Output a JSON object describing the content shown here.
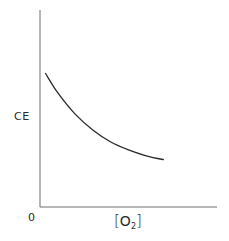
{
  "chart_data": {
    "type": "line",
    "title": "",
    "xlabel": "[O2]",
    "ylabel": "CE",
    "origin_label": "0",
    "x_ticks": [],
    "y_ticks": [],
    "grid": false,
    "legend": null,
    "series": [
      {
        "name": "CE vs [O2]",
        "x": [
          0.03,
          0.1,
          0.2,
          0.3,
          0.4,
          0.5,
          0.6,
          0.7
        ],
        "values": [
          0.68,
          0.58,
          0.47,
          0.39,
          0.33,
          0.29,
          0.26,
          0.24
        ]
      }
    ],
    "xlim": [
      0,
      1
    ],
    "ylim": [
      0,
      1
    ],
    "colors": {
      "axis": "#6e6e6e",
      "curve": "#2a2a2a",
      "text": "#2a2a2a"
    }
  },
  "labels": {
    "ylabel": "CE",
    "origin": "0",
    "xlabel_open": "[",
    "xlabel_main": "O",
    "xlabel_sub": "2",
    "xlabel_close": "]"
  }
}
